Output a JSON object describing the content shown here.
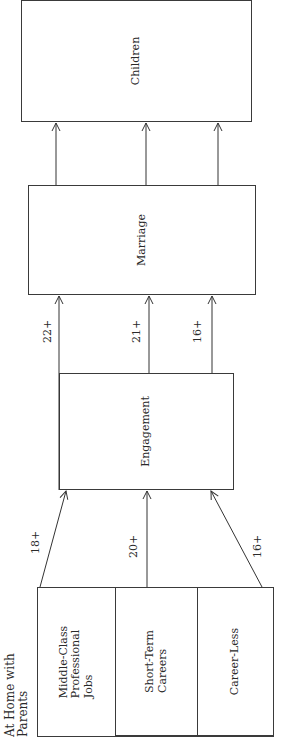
{
  "diagram": {
    "orientation": "rotated-90-ccw",
    "heading": "At Home with Parents",
    "heading_lines": [
      "At Home with",
      "Parents"
    ],
    "origin_groups": [
      {
        "id": "middle-class",
        "label_lines": [
          "Middle-Class",
          "Professional",
          "Jobs"
        ],
        "label": "Middle-Class Professional Jobs"
      },
      {
        "id": "short-term",
        "label_lines": [
          "Short-Term",
          "Careers"
        ],
        "label": "Short-Term Careers"
      },
      {
        "id": "career-less",
        "label_lines": [
          "Career-Less"
        ],
        "label": "Career-Less"
      }
    ],
    "stages": [
      {
        "id": "engagement",
        "label": "Engagement"
      },
      {
        "id": "marriage",
        "label": "Marriage"
      },
      {
        "id": "children",
        "label": "Children"
      }
    ],
    "edges": [
      {
        "from": "middle-class",
        "to": "engagement",
        "label": "18+"
      },
      {
        "from": "short-term",
        "to": "engagement",
        "label": "20+"
      },
      {
        "from": "career-less",
        "to": "engagement",
        "label": "16+"
      },
      {
        "from": "engagement",
        "to": "marriage",
        "label": "22+",
        "track": "middle-class"
      },
      {
        "from": "engagement",
        "to": "marriage",
        "label": "21+",
        "track": "short-term"
      },
      {
        "from": "engagement",
        "to": "marriage",
        "label": "16+",
        "track": "career-less"
      },
      {
        "from": "marriage",
        "to": "children",
        "label": "",
        "track": "middle-class"
      },
      {
        "from": "marriage",
        "to": "children",
        "label": "",
        "track": "short-term"
      },
      {
        "from": "marriage",
        "to": "children",
        "label": "",
        "track": "career-less"
      }
    ]
  }
}
